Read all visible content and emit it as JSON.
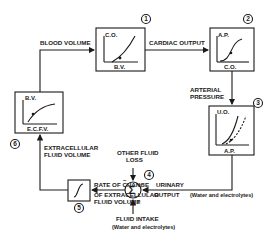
{
  "diagram": {
    "blocks": [
      {
        "id": "1",
        "y_axis": "C.O.",
        "x_axis": "B.V.",
        "curve": "rising"
      },
      {
        "id": "2",
        "y_axis": "A.P.",
        "x_axis": "C.O.",
        "curve": "sigmoid"
      },
      {
        "id": "3",
        "y_axis": "U.O.",
        "x_axis": "A.P.",
        "curve": "steep rising with dashed shifted curve"
      },
      {
        "id": "4",
        "symbol": "Σ",
        "type": "summing junction"
      },
      {
        "id": "5",
        "symbol": "∫",
        "type": "integrator"
      },
      {
        "id": "6",
        "y_axis": "B.V.",
        "x_axis": "E.C.F.V.",
        "curve": "saturating"
      }
    ],
    "labels": {
      "blood_volume": "BLOOD VOLUME",
      "cardiac_output": "CARDIAC OUTPUT",
      "arterial_pressure_1": "ARTERIAL",
      "arterial_pressure_2": "PRESSURE",
      "ecfv_1": "EXTRACELLULAR",
      "ecfv_2": "FLUID VOLUME",
      "rate_1": "RATE OF CHANGE",
      "rate_2": "OF EXTRACELLULAR",
      "rate_3": "FLUID VOLUME",
      "other_loss_1": "OTHER FLUID",
      "other_loss_2": "LOSS",
      "urinary_1": "URINARY",
      "urinary_2": "OUTPUT",
      "urinary_3": "(Water and electrolytes)",
      "intake_1": "FLUID INTAKE",
      "intake_2": "(Water and electrolytes)"
    },
    "signs": {
      "other_loss": "−",
      "urinary": "−",
      "intake": "+"
    }
  }
}
